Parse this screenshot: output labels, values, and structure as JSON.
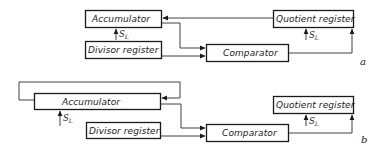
{
  "diagram_a": {
    "tag": "a",
    "blocks": {
      "accumulator": "Accumulator",
      "divisor_register": "Divisor register",
      "comparator": "Comparator",
      "quotient_register": "Quotient register"
    },
    "signals": {
      "shift_left_accumulator": {
        "main": "S",
        "sub": "L"
      },
      "shift_left_quotient": {
        "main": "S",
        "sub": "L"
      }
    }
  },
  "diagram_b": {
    "tag": "b",
    "blocks": {
      "accumulator": "Accumulator",
      "divisor_register": "Divisor register",
      "comparator": "Comparator",
      "quotient_register": "Quotient register"
    },
    "signals": {
      "shift_left_accumulator": {
        "main": "S",
        "sub": "L"
      },
      "shift_left_quotient": {
        "main": "S",
        "sub": "L"
      }
    }
  },
  "colors": {
    "ink": "#1a1a1a",
    "background": "#ffffff"
  }
}
